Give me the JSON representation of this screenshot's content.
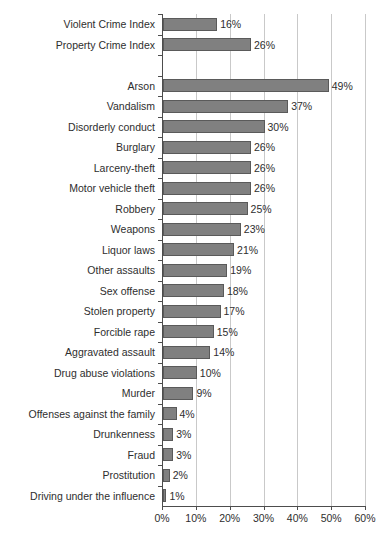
{
  "chart_data": {
    "type": "bar",
    "orientation": "horizontal",
    "title": "",
    "xlabel": "",
    "ylabel": "",
    "xlim": [
      0,
      60
    ],
    "xticks": [
      0,
      10,
      20,
      30,
      40,
      50,
      60
    ],
    "xtick_labels": [
      "0%",
      "10%",
      "20%",
      "30%",
      "40%",
      "50%",
      "60%"
    ],
    "grid": "vertical",
    "legend": "none",
    "value_label_suffix": "%",
    "bar_color": "#808080",
    "bar_edge_color": "#5a5a5a",
    "gridline_color": "#c9c9c9",
    "axis_color": "#4d4d4d",
    "categories": [
      "Violent Crime Index",
      "Property Crime Index",
      "",
      "Arson",
      "Vandalism",
      "Disorderly conduct",
      "Burglary",
      "Larceny-theft",
      "Motor vehicle theft",
      "Robbery",
      "Weapons",
      "Liquor laws",
      "Other assaults",
      "Sex offense",
      "Stolen property",
      "Forcible rape",
      "Aggravated assault",
      "Drug abuse violations",
      "Murder",
      "Offenses against the family",
      "Drunkenness",
      "Fraud",
      "Prostitution",
      "Driving under the influence"
    ],
    "values": [
      16,
      26,
      null,
      49,
      37,
      30,
      26,
      26,
      26,
      25,
      23,
      21,
      19,
      18,
      17,
      15,
      14,
      10,
      9,
      4,
      3,
      3,
      2,
      1
    ],
    "value_labels": [
      "16%",
      "26%",
      "",
      "49%",
      "37%",
      "30%",
      "26%",
      "26%",
      "26%",
      "25%",
      "23%",
      "21%",
      "19%",
      "18%",
      "17%",
      "15%",
      "14%",
      "10%",
      "9%",
      "4%",
      "3%",
      "3%",
      "2%",
      "1%"
    ]
  }
}
